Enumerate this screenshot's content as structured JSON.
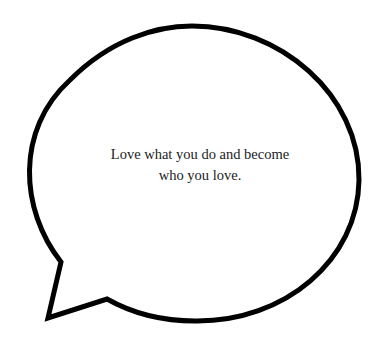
{
  "bubble": {
    "type": "speech-bubble",
    "stroke_color": "#000000",
    "fill_color": "#ffffff",
    "stroke_width": 5
  },
  "quote": {
    "line1": "Love what you do and become",
    "line2": "who you love.",
    "text_color": "#222222"
  }
}
